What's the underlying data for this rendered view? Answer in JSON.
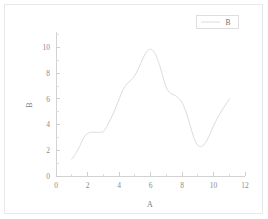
{
  "figure": {
    "background_color": "#ffffff",
    "frame_color": "#e8e8e8",
    "width": 268,
    "height": 219
  },
  "chart_data": {
    "type": "line",
    "title": "",
    "subtitle": "",
    "xlabel": "A",
    "ylabel": "B",
    "xlim": [
      0,
      12
    ],
    "ylim": [
      0,
      11.2
    ],
    "grid": false,
    "legend_position": "top-right",
    "line_color": "#dcdcdc",
    "xticks": [
      0,
      2,
      4,
      6,
      8,
      10,
      12
    ],
    "xtick_labels": [
      "0",
      "2",
      "4",
      "6",
      "8",
      "10",
      "12"
    ],
    "xminor_step": 1,
    "yticks": [
      0,
      2,
      4,
      6,
      8,
      10
    ],
    "ytick_labels": [
      "0",
      "2",
      "4",
      "6",
      "8",
      "10"
    ],
    "yminor_step": 1,
    "series": [
      {
        "name": "B",
        "x": [
          1.0,
          1.25,
          1.5,
          1.75,
          2.0,
          2.25,
          2.5,
          2.75,
          3.0,
          3.25,
          3.5,
          3.75,
          4.0,
          4.25,
          4.5,
          4.75,
          5.0,
          5.25,
          5.5,
          5.75,
          6.0,
          6.25,
          6.5,
          6.75,
          7.0,
          7.25,
          7.5,
          7.75,
          8.0,
          8.25,
          8.5,
          8.75,
          9.0,
          9.25,
          9.5,
          9.75,
          10.0,
          10.25,
          10.5,
          10.75,
          11.0
        ],
        "y": [
          1.3,
          1.75,
          2.3,
          2.95,
          3.3,
          3.4,
          3.4,
          3.4,
          3.45,
          3.9,
          4.5,
          5.2,
          5.95,
          6.7,
          7.15,
          7.45,
          7.8,
          8.4,
          9.1,
          9.65,
          9.85,
          9.6,
          8.9,
          7.9,
          6.9,
          6.45,
          6.3,
          6.1,
          5.7,
          5.0,
          4.0,
          3.0,
          2.4,
          2.3,
          2.6,
          3.2,
          3.9,
          4.5,
          5.05,
          5.5,
          6.0
        ]
      }
    ],
    "legend_entries": [
      {
        "label": "B",
        "color": "#dcdcdc"
      }
    ]
  },
  "legend": {
    "items": [
      {
        "label": "B"
      }
    ]
  },
  "axes": {
    "x_title": "A",
    "y_title": "B"
  }
}
